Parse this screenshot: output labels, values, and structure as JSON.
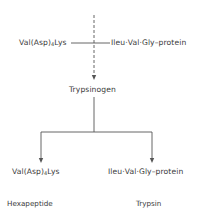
{
  "diagram": {
    "top_row": {
      "left_fragment": {
        "prefix": "Val(Asp)",
        "subscript": "4",
        "suffix": "Lys"
      },
      "right_fragment": "Ileu·Val·Gly–protein"
    },
    "center_node": "Trypsinogen",
    "products": [
      {
        "fragment": {
          "prefix": "Val(Asp)",
          "subscript": "4",
          "suffix": "Lys"
        },
        "name": "Hexapeptide"
      },
      {
        "fragment": "Ileu·Val·Gly–protein",
        "name": "Trypsin"
      }
    ],
    "colors": {
      "line": "#555555",
      "text": "#3a3a3a",
      "background": "#ffffff"
    }
  }
}
